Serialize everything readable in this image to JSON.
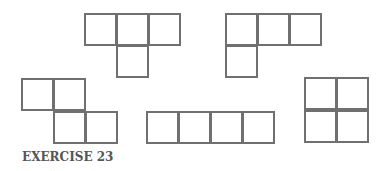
{
  "caption": "EXERCISE 23",
  "colors": {
    "stroke": "#707070",
    "caption": "#555555",
    "background": "#ffffff"
  },
  "cell_size": 33,
  "shapes": [
    {
      "name": "t-tetromino",
      "cells": [
        [
          84,
          13
        ],
        [
          116,
          13
        ],
        [
          148,
          13
        ],
        [
          116,
          45
        ]
      ]
    },
    {
      "name": "l-tetromino",
      "cells": [
        [
          225,
          13
        ],
        [
          257,
          13
        ],
        [
          289,
          13
        ],
        [
          225,
          45
        ]
      ]
    },
    {
      "name": "z-tetromino",
      "cells": [
        [
          21,
          78
        ],
        [
          53,
          78
        ],
        [
          53,
          111
        ],
        [
          85,
          111
        ]
      ]
    },
    {
      "name": "i-tetromino",
      "cells": [
        [
          146,
          111
        ],
        [
          178,
          111
        ],
        [
          210,
          111
        ],
        [
          242,
          111
        ]
      ]
    },
    {
      "name": "o-tetromino",
      "cells": [
        [
          304,
          77
        ],
        [
          336,
          77
        ],
        [
          304,
          110
        ],
        [
          336,
          110
        ]
      ]
    }
  ]
}
